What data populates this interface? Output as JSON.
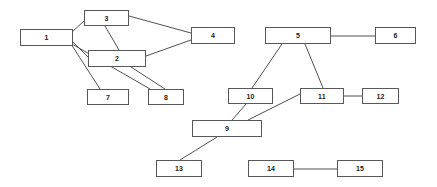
{
  "diagram": {
    "type": "node-link-diagram",
    "canvas": {
      "width": 437,
      "height": 187,
      "background_color": "#ffffff"
    },
    "style": {
      "node_fill": "#ffffff",
      "node_stroke": "#58585a",
      "node_stroke_width": 1,
      "edge_stroke": "#3c3c3c",
      "edge_stroke_width": 0.9,
      "label_color": "#1a1a1a"
    },
    "nodes": [
      {
        "id": "1",
        "label": "1",
        "x": 20,
        "y": 29,
        "width": 53,
        "height": 17
      },
      {
        "id": "2",
        "label": "2",
        "x": 88,
        "y": 50,
        "width": 58,
        "height": 17
      },
      {
        "id": "3",
        "label": "3",
        "x": 84,
        "y": 10,
        "width": 45,
        "height": 16
      },
      {
        "id": "4",
        "label": "4",
        "x": 191,
        "y": 27,
        "width": 44,
        "height": 17
      },
      {
        "id": "5",
        "label": "5",
        "x": 265,
        "y": 27,
        "width": 66,
        "height": 17
      },
      {
        "id": "6",
        "label": "6",
        "x": 375,
        "y": 27,
        "width": 41,
        "height": 17
      },
      {
        "id": "7",
        "label": "7",
        "x": 87,
        "y": 89,
        "width": 42,
        "height": 16
      },
      {
        "id": "8",
        "label": "8",
        "x": 148,
        "y": 89,
        "width": 36,
        "height": 16
      },
      {
        "id": "9",
        "label": "9",
        "x": 192,
        "y": 120,
        "width": 70,
        "height": 17
      },
      {
        "id": "10",
        "label": "10",
        "x": 228,
        "y": 88,
        "width": 45,
        "height": 16
      },
      {
        "id": "11",
        "label": "11",
        "x": 300,
        "y": 88,
        "width": 44,
        "height": 16
      },
      {
        "id": "12",
        "label": "12",
        "x": 362,
        "y": 88,
        "width": 37,
        "height": 16
      },
      {
        "id": "13",
        "label": "13",
        "x": 156,
        "y": 160,
        "width": 46,
        "height": 17
      },
      {
        "id": "14",
        "label": "14",
        "x": 248,
        "y": 160,
        "width": 46,
        "height": 17
      },
      {
        "id": "15",
        "label": "15",
        "x": 337,
        "y": 160,
        "width": 46,
        "height": 17
      }
    ],
    "edges": [
      {
        "source": "1",
        "target": "3",
        "x1": 73,
        "y1": 31,
        "x2": 84,
        "y2": 21
      },
      {
        "source": "3",
        "target": "4",
        "x1": 129,
        "y1": 16,
        "x2": 191,
        "y2": 33
      },
      {
        "source": "3",
        "target": "2",
        "x1": 105,
        "y1": 26,
        "x2": 119,
        "y2": 50
      },
      {
        "source": "1",
        "target": "2",
        "x1": 73,
        "y1": 42,
        "x2": 88,
        "y2": 57
      },
      {
        "source": "2",
        "target": "4",
        "x1": 146,
        "y1": 56,
        "x2": 191,
        "y2": 40
      },
      {
        "source": "1",
        "target": "7",
        "x1": 71,
        "y1": 44,
        "x2": 100,
        "y2": 89
      },
      {
        "source": "1",
        "target": "8",
        "x1": 72,
        "y1": 44,
        "x2": 150,
        "y2": 89
      },
      {
        "source": "2",
        "target": "8",
        "x1": 131,
        "y1": 67,
        "x2": 165,
        "y2": 89
      },
      {
        "source": "5",
        "target": "6",
        "x1": 331,
        "y1": 36,
        "x2": 375,
        "y2": 36
      },
      {
        "source": "5",
        "target": "10",
        "x1": 282,
        "y1": 44,
        "x2": 252,
        "y2": 88
      },
      {
        "source": "5",
        "target": "11",
        "x1": 305,
        "y1": 44,
        "x2": 323,
        "y2": 88
      },
      {
        "source": "10",
        "target": "9",
        "x1": 246,
        "y1": 104,
        "x2": 232,
        "y2": 120
      },
      {
        "source": "11",
        "target": "9",
        "x1": 300,
        "y1": 94,
        "x2": 248,
        "y2": 120
      },
      {
        "source": "11",
        "target": "12",
        "x1": 344,
        "y1": 96,
        "x2": 362,
        "y2": 96
      },
      {
        "source": "9",
        "target": "13",
        "x1": 217,
        "y1": 137,
        "x2": 180,
        "y2": 160
      },
      {
        "source": "14",
        "target": "15",
        "x1": 294,
        "y1": 169,
        "x2": 337,
        "y2": 169
      }
    ]
  }
}
